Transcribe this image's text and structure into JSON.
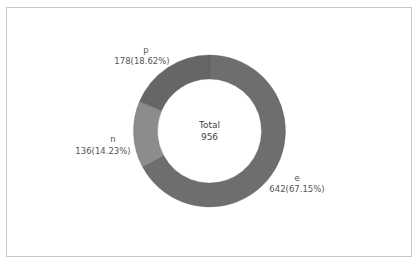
{
  "chart_data": {
    "type": "pie",
    "variant": "donut",
    "title": "",
    "center_label": {
      "title": "Total",
      "value": "956"
    },
    "categories": [
      "e",
      "n",
      "p"
    ],
    "values": [
      642,
      136,
      178
    ],
    "percentages": [
      67.15,
      14.23,
      18.62
    ],
    "labels": [
      "642(67.15%)",
      "136(14.23%)",
      "178(18.62%)"
    ],
    "colors": [
      "#6e6e6e",
      "#8c8c8c",
      "#666666"
    ],
    "start_angle_deg": 0,
    "direction": "clockwise",
    "legend": "none"
  },
  "labels": {
    "e_name": "e",
    "e_value": "642(67.15%)",
    "n_name": "n",
    "n_value": "136(14.23%)",
    "p_name": "p",
    "p_value": "178(18.62%)",
    "total_title": "Total",
    "total_value": "956"
  }
}
